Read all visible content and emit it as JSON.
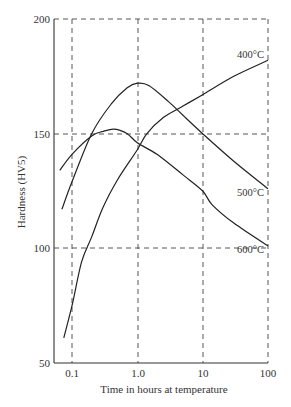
{
  "chart_data": {
    "type": "line",
    "title": "",
    "xlabel": "Time in hours at temperature",
    "ylabel": "Hardness (HV5)",
    "xscale": "log",
    "xlim": [
      0.053,
      100
    ],
    "ylim": [
      50,
      200
    ],
    "grid": "dashed at major ticks",
    "x_ticks": [
      "0.1",
      "1.0",
      "10",
      "100"
    ],
    "x_tick_values": [
      0.1,
      1.0,
      10,
      100
    ],
    "y_ticks": [
      "50",
      "100",
      "150",
      "200"
    ],
    "y_tick_values": [
      50,
      100,
      150,
      200
    ],
    "legend": "inline labels at right end of curves",
    "series": [
      {
        "name": "400°C",
        "label": "400°C",
        "points": [
          [
            0.075,
            61
          ],
          [
            0.1,
            75
          ],
          [
            0.14,
            94
          ],
          [
            0.2,
            105
          ],
          [
            0.3,
            118
          ],
          [
            0.5,
            130
          ],
          [
            1.0,
            143
          ],
          [
            1.4,
            150
          ],
          [
            2.5,
            157
          ],
          [
            5,
            162
          ],
          [
            10,
            167
          ],
          [
            30,
            175
          ],
          [
            100,
            182
          ]
        ]
      },
      {
        "name": "500°C",
        "label": "500°C",
        "points": [
          [
            0.07,
            117
          ],
          [
            0.1,
            129
          ],
          [
            0.2,
            150
          ],
          [
            0.4,
            163
          ],
          [
            0.7,
            170
          ],
          [
            1.0,
            172
          ],
          [
            1.5,
            171
          ],
          [
            3,
            164
          ],
          [
            5,
            158
          ],
          [
            10,
            150
          ],
          [
            30,
            138
          ],
          [
            100,
            126
          ]
        ]
      },
      {
        "name": "600°C",
        "label": "600°C",
        "points": [
          [
            0.065,
            134
          ],
          [
            0.1,
            141
          ],
          [
            0.2,
            149
          ],
          [
            0.3,
            151
          ],
          [
            0.45,
            152
          ],
          [
            0.7,
            150
          ],
          [
            1.0,
            146
          ],
          [
            2,
            141
          ],
          [
            5,
            132
          ],
          [
            10,
            125
          ],
          [
            14,
            119
          ],
          [
            30,
            111
          ],
          [
            100,
            101
          ]
        ]
      }
    ]
  },
  "axis": {
    "xlabel": "Time in hours at temperature",
    "ylabel": "Hardness (HV5)",
    "x_ticks": [
      "0.1",
      "1.0",
      "10",
      "100"
    ],
    "y_ticks": [
      "50",
      "100",
      "150",
      "200"
    ]
  },
  "labels": {
    "s400": "400°C",
    "s500": "500°C",
    "s600": "600°C"
  }
}
